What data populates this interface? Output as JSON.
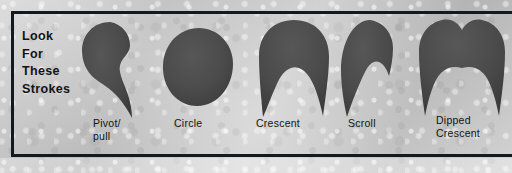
{
  "figure": {
    "caption_lines": [
      "Look",
      "For",
      "These",
      "Strokes"
    ],
    "frame_color": "#16181a",
    "paper_color": "#c6c6c6",
    "stroke_fill_color": "#4a4a4a",
    "text_color": "#121314"
  },
  "strokes": [
    {
      "id": "pivot-pull",
      "label_lines": [
        "Pivot/",
        "pull"
      ],
      "shape_name": "pivot-pull-stroke"
    },
    {
      "id": "circle",
      "label_lines": [
        "Circle"
      ],
      "shape_name": "circle-stroke"
    },
    {
      "id": "crescent",
      "label_lines": [
        "Crescent"
      ],
      "shape_name": "crescent-stroke"
    },
    {
      "id": "scroll",
      "label_lines": [
        "Scroll"
      ],
      "shape_name": "scroll-stroke"
    },
    {
      "id": "dipped-crescent",
      "label_lines": [
        "Dipped",
        "Crescent"
      ],
      "shape_name": "dipped-crescent-stroke"
    }
  ]
}
